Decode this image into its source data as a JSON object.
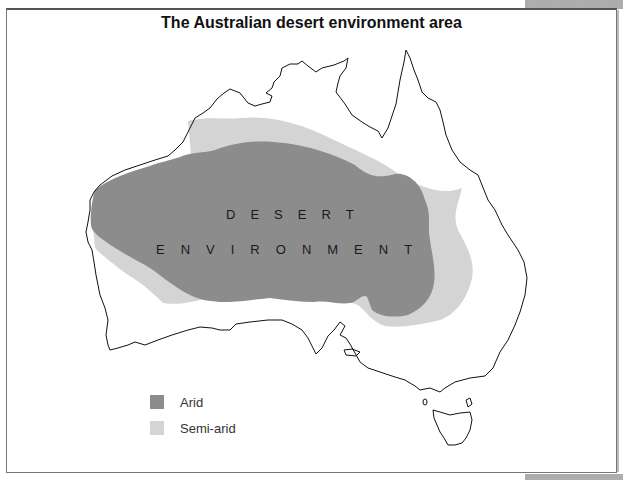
{
  "title": "The Australian desert environment area",
  "map": {
    "region": "Australia",
    "labels": {
      "line1": [
        "D",
        "E",
        "S",
        "E",
        "R",
        "T"
      ],
      "line2": [
        "E",
        "N",
        "V",
        "I",
        "R",
        "O",
        "N",
        "M",
        "E",
        "N",
        "T"
      ]
    }
  },
  "legend": {
    "items": [
      {
        "label": "Arid",
        "color": "#8c8c8c"
      },
      {
        "label": "Semi-arid",
        "color": "#d4d4d4"
      }
    ]
  },
  "colors": {
    "arid": "#8c8c8c",
    "semi_arid": "#d4d4d4",
    "coastline": "#111111"
  }
}
